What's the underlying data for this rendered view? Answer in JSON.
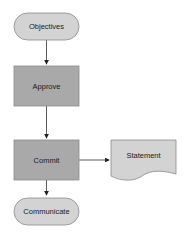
{
  "diagram": {
    "type": "flowchart",
    "nodes": [
      {
        "id": "objectives",
        "label": "Objectives",
        "shape": "terminator",
        "fill": "#d3d3d3"
      },
      {
        "id": "approve",
        "label": "Approve",
        "shape": "process",
        "fill": "#a9a9a9"
      },
      {
        "id": "commit",
        "label": "Commit",
        "shape": "process",
        "fill": "#a9a9a9"
      },
      {
        "id": "statement",
        "label": "Statement",
        "shape": "document",
        "fill": "#d3d3d3"
      },
      {
        "id": "communicate",
        "label": "Communicate",
        "shape": "terminator",
        "fill": "#d3d3d3"
      }
    ],
    "edges": [
      {
        "from": "objectives",
        "to": "approve"
      },
      {
        "from": "approve",
        "to": "commit"
      },
      {
        "from": "commit",
        "to": "statement"
      },
      {
        "from": "commit",
        "to": "communicate"
      }
    ],
    "colors": {
      "stroke": "#8c8c8c",
      "line": "#333333",
      "background": "#ffffff"
    }
  }
}
